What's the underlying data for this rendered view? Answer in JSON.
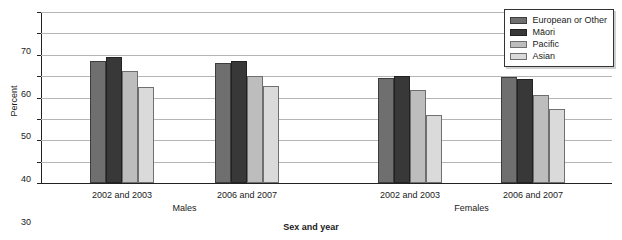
{
  "chart_data": {
    "type": "bar",
    "title": "",
    "xlabel": "Sex and year",
    "ylabel": "Percent",
    "ylim": [
      0,
      80
    ],
    "yticks": [
      0,
      10,
      20,
      30,
      40,
      50,
      60,
      70
    ],
    "ytick_labels": [
      "0",
      "10",
      "20",
      "30",
      "40",
      "50",
      "60",
      "70"
    ],
    "grid": true,
    "legend_position": "top-right",
    "categories": [
      "2002 and 2003",
      "2006 and 2007",
      "2002 and 2003",
      "2006 and 2007"
    ],
    "supergroups": [
      {
        "label": "Males",
        "categories": [
          "2002 and 2003",
          "2006 and 2007"
        ]
      },
      {
        "label": "Females",
        "categories": [
          "2002 and 2003",
          "2006 and 2007"
        ]
      }
    ],
    "series": [
      {
        "name": "European or Other",
        "color": "#6f6f6f",
        "values": [
          57,
          56,
          49,
          49.5
        ]
      },
      {
        "name": "Māori",
        "color": "#383838",
        "values": [
          59,
          57,
          50,
          48.5
        ]
      },
      {
        "name": "Pacific",
        "color": "#bdbdbd",
        "values": [
          52.5,
          50,
          43.5,
          41
        ]
      },
      {
        "name": "Asian",
        "color": "#dadada",
        "values": [
          45,
          45.5,
          32,
          34.5
        ]
      }
    ]
  },
  "legend": {
    "items": [
      {
        "label": "European or Other"
      },
      {
        "label": "Māori"
      },
      {
        "label": "Pacific"
      },
      {
        "label": "Asian"
      }
    ]
  }
}
